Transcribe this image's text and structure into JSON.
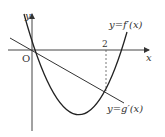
{
  "diagram": {
    "type": "function-graph",
    "axes": {
      "x_label": "x",
      "y_label": "y",
      "origin_label": "O"
    },
    "tick_labels": {
      "x_tick": "2"
    },
    "curves": [
      {
        "name": "f-prime",
        "label": "y=f′(x)",
        "shape": "parabola",
        "passes_through_origin": true
      },
      {
        "name": "g-prime",
        "label": "y=g′(x)",
        "shape": "line",
        "passes_through_origin": true
      }
    ],
    "intersection_x": 2,
    "colors": {
      "stroke": "#333333",
      "background": "#ffffff"
    }
  }
}
